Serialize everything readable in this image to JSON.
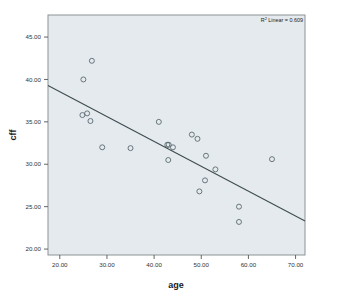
{
  "chart_data": {
    "type": "scatter",
    "title": "",
    "xlabel": "age",
    "ylabel": "cff",
    "xlim": [
      17.5,
      72.0
    ],
    "ylim": [
      19.3,
      47.6
    ],
    "xticks": [
      20,
      30,
      40,
      50,
      60,
      70
    ],
    "xticklabels": [
      "20.00",
      "30.00",
      "40.00",
      "50.00",
      "60.00",
      "70.00"
    ],
    "yticks": [
      20,
      25,
      30,
      35,
      40,
      45
    ],
    "yticklabels": [
      "20.00",
      "25.00",
      "30.00",
      "35.00",
      "40.00",
      "45.00"
    ],
    "grid": false,
    "legend_position": "none",
    "marker": "open-circle",
    "marker_color": "#5a6a72",
    "plot_background": "#e4eaed",
    "frame_color": "#8c9396",
    "points": [
      {
        "x": 25.0,
        "y": 40.0
      },
      {
        "x": 26.8,
        "y": 42.2
      },
      {
        "x": 24.8,
        "y": 35.8
      },
      {
        "x": 25.8,
        "y": 36.0
      },
      {
        "x": 26.5,
        "y": 35.1
      },
      {
        "x": 29.0,
        "y": 32.0
      },
      {
        "x": 35.0,
        "y": 31.9
      },
      {
        "x": 41.0,
        "y": 35.0
      },
      {
        "x": 42.8,
        "y": 32.3
      },
      {
        "x": 43.1,
        "y": 32.3
      },
      {
        "x": 43.0,
        "y": 30.5
      },
      {
        "x": 44.0,
        "y": 32.0
      },
      {
        "x": 48.0,
        "y": 33.5
      },
      {
        "x": 49.2,
        "y": 33.0
      },
      {
        "x": 51.0,
        "y": 31.0
      },
      {
        "x": 53.0,
        "y": 29.4
      },
      {
        "x": 50.8,
        "y": 28.1
      },
      {
        "x": 49.6,
        "y": 26.8
      },
      {
        "x": 58.0,
        "y": 25.0
      },
      {
        "x": 58.0,
        "y": 23.2
      },
      {
        "x": 65.0,
        "y": 30.6
      }
    ],
    "fit_line": {
      "type": "linear",
      "r_squared": 0.609,
      "annotation_prefix": "R",
      "annotation_superscript": "2",
      "annotation_text": " Linear = 0.609",
      "x_start": 17.5,
      "y_start": 39.3,
      "x_end": 72.0,
      "y_end": 23.3,
      "color": "#3f4c52"
    }
  }
}
